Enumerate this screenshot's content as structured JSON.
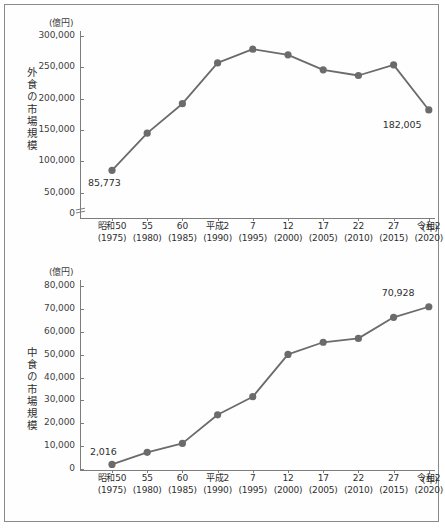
{
  "figure": {
    "unit_label": "(億円)",
    "x_axis_unit": "(年)"
  },
  "charts": [
    {
      "id": "gaishoku",
      "axis_title": "外食の市場規模",
      "unit_label": "(億円)",
      "x_axis_unit": "(年)",
      "has_axis_break": true
    },
    {
      "id": "nakashoku",
      "axis_title": "中食の市場規模",
      "unit_label": "(億円)",
      "x_axis_unit": "(年)",
      "has_axis_break": false
    }
  ],
  "chart_data": [
    {
      "type": "line",
      "title": "外食の市場規模",
      "xlabel": "(年)",
      "ylabel": "(億円)",
      "categories": [
        "昭和50\n(1975)",
        "55\n(1980)",
        "60\n(1985)",
        "平成2\n(1990)",
        "7\n(1995)",
        "12\n(2000)",
        "17\n(2005)",
        "22\n(2010)",
        "27\n(2015)",
        "令和2\n(2020)"
      ],
      "era_labels": [
        "昭和50",
        "55",
        "60",
        "平成2",
        "7",
        "12",
        "17",
        "22",
        "27",
        "令和2"
      ],
      "year_labels": [
        "(1975)",
        "(1980)",
        "(1985)",
        "(1990)",
        "(1995)",
        "(2000)",
        "(2005)",
        "(2010)",
        "(2015)",
        "(2020)"
      ],
      "values": [
        85773,
        145000,
        192000,
        257000,
        279000,
        270000,
        246000,
        237000,
        254000,
        182005
      ],
      "point_labels": [
        {
          "index": 0,
          "text": "85,773"
        },
        {
          "index": 9,
          "text": "182,005"
        }
      ],
      "yticks": [
        0,
        50000,
        100000,
        150000,
        200000,
        250000,
        300000
      ],
      "ytick_labels": [
        "0",
        "50,000",
        "100,000",
        "150,000",
        "200,000",
        "250,000",
        "300,000"
      ],
      "ylim": [
        0,
        300000
      ],
      "axis_break": true,
      "grid": false,
      "legend": "none",
      "line_color": "#6b6b6b",
      "marker_color": "#6b6b6b"
    },
    {
      "type": "line",
      "title": "中食の市場規模",
      "xlabel": "(年)",
      "ylabel": "(億円)",
      "categories": [
        "昭和50\n(1975)",
        "55\n(1980)",
        "60\n(1985)",
        "平成2\n(1990)",
        "7\n(1995)",
        "12\n(2000)",
        "17\n(2005)",
        "22\n(2010)",
        "27\n(2015)",
        "令和2\n(2020)"
      ],
      "era_labels": [
        "昭和50",
        "55",
        "60",
        "平成2",
        "7",
        "12",
        "17",
        "22",
        "27",
        "令和2"
      ],
      "year_labels": [
        "(1975)",
        "(1980)",
        "(1985)",
        "(1990)",
        "(1995)",
        "(2000)",
        "(2005)",
        "(2010)",
        "(2015)",
        "(2020)"
      ],
      "values": [
        2016,
        7300,
        11200,
        23700,
        31600,
        50100,
        55400,
        57100,
        66300,
        70928
      ],
      "point_labels": [
        {
          "index": 0,
          "text": "2,016"
        },
        {
          "index": 9,
          "text": "70,928"
        }
      ],
      "yticks": [
        0,
        10000,
        20000,
        30000,
        40000,
        50000,
        60000,
        70000,
        80000
      ],
      "ytick_labels": [
        "0",
        "10,000",
        "20,000",
        "30,000",
        "40,000",
        "50,000",
        "60,000",
        "70,000",
        "80,000"
      ],
      "ylim": [
        0,
        80000
      ],
      "axis_break": false,
      "grid": false,
      "legend": "none",
      "line_color": "#6b6b6b",
      "marker_color": "#6b6b6b"
    }
  ]
}
